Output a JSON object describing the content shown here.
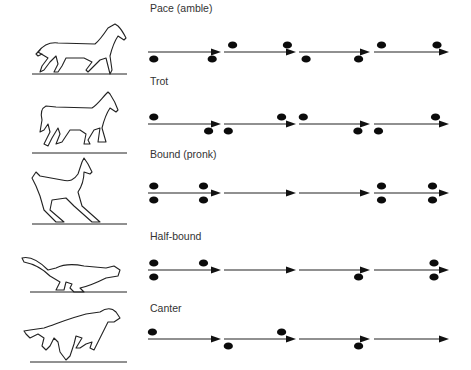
{
  "figure": {
    "gaits": [
      {
        "label": "Pace (amble)",
        "animal": "horse-pacing",
        "segments": 4,
        "footfalls": [
          {
            "seg": 0,
            "pos": 0.08,
            "side": "below"
          },
          {
            "seg": 0,
            "pos": 0.88,
            "side": "below"
          },
          {
            "seg": 1,
            "pos": 0.12,
            "side": "above"
          },
          {
            "seg": 1,
            "pos": 0.88,
            "side": "above"
          },
          {
            "seg": 2,
            "pos": 0.1,
            "side": "below"
          },
          {
            "seg": 2,
            "pos": 0.84,
            "side": "below"
          },
          {
            "seg": 3,
            "pos": 0.1,
            "side": "above"
          },
          {
            "seg": 3,
            "pos": 0.84,
            "side": "above"
          }
        ]
      },
      {
        "label": "Trot",
        "animal": "horse-trotting",
        "segments": 4,
        "footfalls": [
          {
            "seg": 0,
            "pos": 0.08,
            "side": "above"
          },
          {
            "seg": 0,
            "pos": 0.83,
            "side": "below"
          },
          {
            "seg": 1,
            "pos": 0.06,
            "side": "below"
          },
          {
            "seg": 1,
            "pos": 0.8,
            "side": "above"
          },
          {
            "seg": 2,
            "pos": 0.06,
            "side": "above"
          },
          {
            "seg": 2,
            "pos": 0.83,
            "side": "below"
          },
          {
            "seg": 3,
            "pos": 0.06,
            "side": "below"
          },
          {
            "seg": 3,
            "pos": 0.82,
            "side": "above"
          }
        ]
      },
      {
        "label": "Bound (pronk)",
        "animal": "deer-pronking",
        "segments": 4,
        "footfalls": [
          {
            "seg": 0,
            "pos": 0.08,
            "side": "above"
          },
          {
            "seg": 0,
            "pos": 0.08,
            "side": "below"
          },
          {
            "seg": 0,
            "pos": 0.76,
            "side": "above"
          },
          {
            "seg": 0,
            "pos": 0.76,
            "side": "below"
          },
          {
            "seg": 3,
            "pos": 0.1,
            "side": "above"
          },
          {
            "seg": 3,
            "pos": 0.1,
            "side": "below"
          },
          {
            "seg": 3,
            "pos": 0.78,
            "side": "above"
          },
          {
            "seg": 3,
            "pos": 0.78,
            "side": "below"
          }
        ]
      },
      {
        "label": "Half-bound",
        "animal": "ferret-half-bounding",
        "segments": 4,
        "footfalls": [
          {
            "seg": 0,
            "pos": 0.08,
            "side": "above"
          },
          {
            "seg": 0,
            "pos": 0.08,
            "side": "below"
          },
          {
            "seg": 0,
            "pos": 0.76,
            "side": "above"
          },
          {
            "seg": 2,
            "pos": 0.84,
            "side": "below"
          },
          {
            "seg": 3,
            "pos": 0.8,
            "side": "above"
          },
          {
            "seg": 3,
            "pos": 0.8,
            "side": "below"
          }
        ]
      },
      {
        "label": "Canter",
        "animal": "dog-cantering",
        "segments": 4,
        "footfalls": [
          {
            "seg": 0,
            "pos": 0.06,
            "side": "above"
          },
          {
            "seg": 1,
            "pos": 0.06,
            "side": "below"
          },
          {
            "seg": 1,
            "pos": 0.8,
            "side": "above"
          },
          {
            "seg": 2,
            "pos": 0.84,
            "side": "below"
          }
        ]
      }
    ]
  }
}
